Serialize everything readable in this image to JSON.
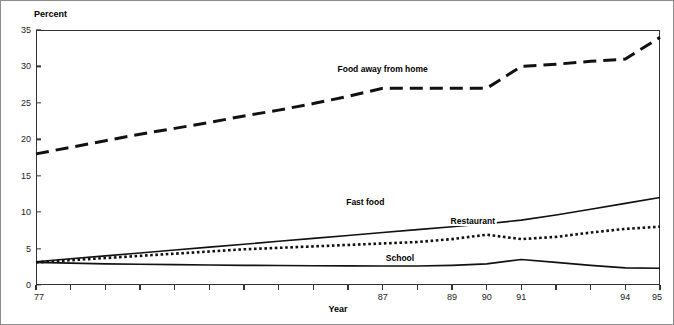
{
  "chart_data": {
    "type": "line",
    "title": "",
    "xlabel": "Year",
    "ylabel": "Percent",
    "xlim": [
      77,
      95
    ],
    "ylim": [
      0,
      35
    ],
    "grid": false,
    "legend_position": "inline-annotations",
    "x": [
      77,
      78,
      79,
      80,
      81,
      82,
      83,
      84,
      85,
      86,
      87,
      88,
      89,
      90,
      91,
      92,
      93,
      94,
      95
    ],
    "yticks": [
      0,
      5,
      10,
      15,
      20,
      25,
      30,
      35
    ],
    "xticks_labeled": [
      77,
      87,
      89,
      90,
      91,
      94,
      95
    ],
    "xticks_all": [
      77,
      78,
      79,
      80,
      81,
      82,
      83,
      84,
      85,
      86,
      87,
      88,
      89,
      90,
      91,
      92,
      93,
      94,
      95
    ],
    "series": [
      {
        "name": "Food away from home",
        "style": "dashed",
        "label_x": 87,
        "label_y": 29.5,
        "values": [
          18.0,
          18.9,
          19.8,
          20.7,
          21.5,
          22.3,
          23.2,
          24.0,
          24.9,
          25.9,
          27.0,
          27.0,
          27.0,
          27.0,
          30.0,
          30.3,
          30.7,
          31.0,
          34.0
        ]
      },
      {
        "name": "Fast food",
        "style": "solid",
        "label_x": 86.5,
        "label_y": 11.2,
        "values": [
          3.2,
          3.6,
          4.0,
          4.4,
          4.8,
          5.2,
          5.6,
          6.0,
          6.4,
          6.8,
          7.2,
          7.6,
          8.0,
          8.4,
          8.9,
          9.6,
          10.4,
          11.2,
          12.0
        ]
      },
      {
        "name": "Restaurant",
        "style": "dotted",
        "label_x": 89.6,
        "label_y": 8.6,
        "values": [
          3.1,
          3.4,
          3.7,
          4.0,
          4.3,
          4.6,
          4.9,
          5.1,
          5.3,
          5.5,
          5.7,
          5.9,
          6.3,
          6.9,
          6.3,
          6.6,
          7.2,
          7.7,
          8.0
        ]
      },
      {
        "name": "School",
        "style": "solid",
        "label_x": 87.5,
        "label_y": 3.6,
        "values": [
          3.1,
          3.0,
          2.9,
          2.85,
          2.8,
          2.75,
          2.7,
          2.68,
          2.65,
          2.62,
          2.6,
          2.6,
          2.7,
          2.9,
          3.5,
          3.1,
          2.7,
          2.35,
          2.3
        ]
      }
    ]
  }
}
